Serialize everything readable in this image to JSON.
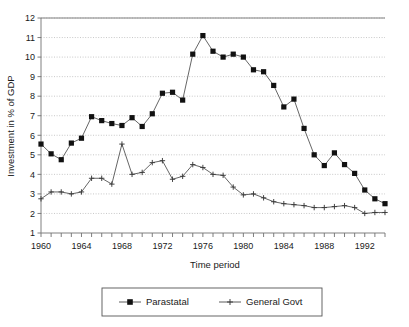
{
  "chart_data": {
    "type": "line",
    "title": "",
    "xlabel": "Time period",
    "ylabel": "Investment in % of GDP",
    "xlim": [
      1960,
      1994
    ],
    "ylim": [
      1,
      12
    ],
    "ytick_step": 1,
    "yticks": [
      1,
      2,
      3,
      4,
      5,
      6,
      7,
      8,
      9,
      10,
      11,
      12
    ],
    "ytick_labels": [
      "1",
      "2",
      "3",
      "4",
      "5",
      "6",
      "7",
      "8",
      "9",
      "10",
      "11",
      "12"
    ],
    "xticks_labeled": [
      1960,
      1964,
      1968,
      1972,
      1976,
      1980,
      1984,
      1988,
      1992
    ],
    "xtick_labels": [
      "1960",
      "1964",
      "1968",
      "1972",
      "1976",
      "1980",
      "1984",
      "1988",
      "1992"
    ],
    "xtick_step_minor": 1,
    "grid": "horizontal-dotted",
    "legend_position": "below-center",
    "x": [
      1960,
      1961,
      1962,
      1963,
      1964,
      1965,
      1966,
      1967,
      1968,
      1969,
      1970,
      1971,
      1972,
      1973,
      1974,
      1975,
      1976,
      1977,
      1978,
      1979,
      1980,
      1981,
      1982,
      1983,
      1984,
      1985,
      1986,
      1987,
      1988,
      1989,
      1990,
      1991,
      1992,
      1993,
      1994
    ],
    "series": [
      {
        "name": "Parastatal",
        "marker": "filled-square",
        "color": "#111111",
        "values": [
          5.55,
          5.05,
          4.75,
          5.6,
          5.85,
          6.95,
          6.75,
          6.6,
          6.5,
          6.9,
          6.45,
          7.1,
          8.15,
          8.2,
          7.8,
          10.15,
          11.1,
          10.3,
          10.0,
          10.15,
          10.0,
          9.35,
          9.25,
          8.55,
          7.45,
          7.85,
          6.35,
          5.0,
          4.45,
          5.1,
          4.5,
          4.05,
          3.2,
          2.75,
          2.5
        ]
      },
      {
        "name": "General Govt",
        "marker": "plus",
        "color": "#3a3a3a",
        "values": [
          2.75,
          3.1,
          3.1,
          3.0,
          3.1,
          3.8,
          3.8,
          3.5,
          5.55,
          4.0,
          4.1,
          4.6,
          4.7,
          3.75,
          3.9,
          4.5,
          4.35,
          4.0,
          3.95,
          3.35,
          2.95,
          3.0,
          2.8,
          2.6,
          2.5,
          2.45,
          2.4,
          2.3,
          2.3,
          2.35,
          2.4,
          2.3,
          2.0,
          2.05,
          2.05
        ]
      }
    ]
  },
  "legend": {
    "items": [
      {
        "label": "Parastatal"
      },
      {
        "label": "General Govt"
      }
    ]
  },
  "axes": {
    "x_title": "Time period",
    "y_title": "Investment in % of GDP"
  }
}
